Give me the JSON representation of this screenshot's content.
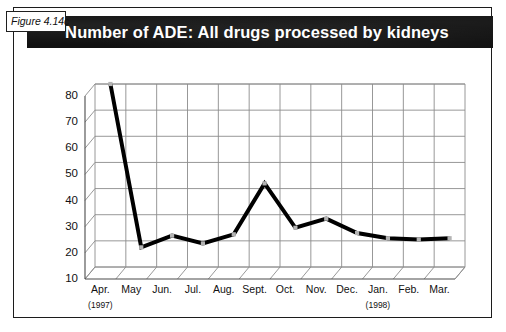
{
  "figure": {
    "tag": "Figure 4.14c",
    "title": "Number of ADE: All drugs processed by kidneys"
  },
  "colors": {
    "title_band": "#111111",
    "title_text": "#ffffff",
    "frame": "#1c1c1c",
    "series_line": "#000000",
    "gridline": "#8c8c8c",
    "marker": "#b3b3b3"
  },
  "chart_data": {
    "type": "line",
    "title": "Number of ADE: All drugs processed by kidneys",
    "xlabel": "",
    "ylabel": "",
    "categories": [
      "Apr.",
      "May",
      "Jun.",
      "Jul.",
      "Aug.",
      "Sept.",
      "Oct.",
      "Nov.",
      "Dec.",
      "Jan.",
      "Feb.",
      "Mar."
    ],
    "values": [
      80,
      17.5,
      22,
      19,
      22.5,
      42,
      25,
      28.5,
      23,
      21,
      20.5,
      21
    ],
    "ylim": [
      10,
      80
    ],
    "yticks": [
      10,
      20,
      30,
      40,
      50,
      60,
      70,
      80
    ],
    "ytick_labels": [
      "10",
      "20",
      "30",
      "40",
      "50",
      "60",
      "70",
      "80"
    ],
    "grid": true,
    "legend": false,
    "style": "3d-line",
    "annotations": [
      {
        "text": "(1997)",
        "under_category": "Apr."
      },
      {
        "text": "(1998)",
        "under_category": "Jan."
      }
    ]
  }
}
